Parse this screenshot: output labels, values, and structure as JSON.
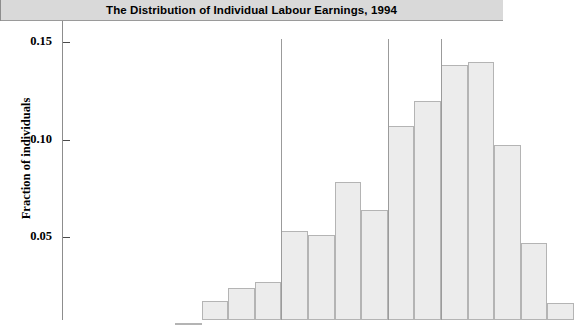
{
  "figure": {
    "title": "The Distribution of Individual Labour Earnings, 1994",
    "title_background": "#d9d9d9",
    "bar_fill": "#ececec",
    "bar_border": "#b4b4b4",
    "reference_line_color": "#9b9b9b"
  },
  "axis": {
    "y_title": "Fraction of individuals",
    "y_ticks": [
      {
        "label": "0.05",
        "value": 0.05
      },
      {
        "label": "0.10",
        "value": 0.1
      },
      {
        "label": "0.15",
        "value": 0.15
      }
    ]
  },
  "chart_data": {
    "type": "bar",
    "title": "The Distribution of Individual Labour Earnings, 1994",
    "xlabel": "",
    "ylabel": "Fraction of individuals",
    "ylim": [
      0,
      0.155
    ],
    "grid": false,
    "legend": null,
    "categories": [
      "bin-1",
      "bin-2",
      "bin-3",
      "bin-4",
      "bin-5",
      "bin-6",
      "bin-7",
      "bin-8",
      "bin-9",
      "bin-10",
      "bin-11",
      "bin-12",
      "bin-13",
      "bin-14",
      "bin-15"
    ],
    "values": [
      0.006,
      0.017,
      0.024,
      0.027,
      0.053,
      0.051,
      0.078,
      0.064,
      0.107,
      0.12,
      0.138,
      0.14,
      0.097,
      0.047,
      0.016
    ],
    "annotations": [
      {
        "name": "reference-line-1",
        "type": "vline",
        "at_bin_edge": 4
      },
      {
        "name": "reference-line-2",
        "type": "vline",
        "at_bin_edge": 8
      },
      {
        "name": "reference-line-3",
        "type": "vline",
        "at_bin_edge": 10
      }
    ]
  }
}
